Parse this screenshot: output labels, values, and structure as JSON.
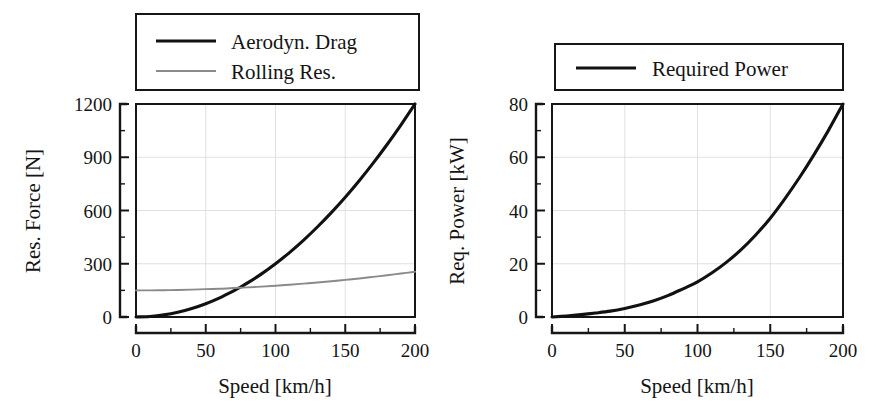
{
  "figure": {
    "panels": [
      {
        "id": "resistive-force",
        "legend": {
          "entries": [
            {
              "label": "Aerodyn. Drag",
              "style": "thick-black",
              "color": "#111111"
            },
            {
              "label": "Rolling Res.",
              "style": "thin-gray",
              "color": "#8a8a8a"
            }
          ]
        }
      },
      {
        "id": "required-power",
        "legend": {
          "entries": [
            {
              "label": "Required Power",
              "style": "thick-black",
              "color": "#111111"
            }
          ]
        }
      }
    ]
  },
  "chart_data": [
    {
      "type": "line",
      "title": "",
      "xlabel": "Speed [km/h]",
      "ylabel": "Res. Force [N]",
      "xlim": [
        0,
        200
      ],
      "ylim": [
        0,
        1200
      ],
      "xticks": [
        0,
        50,
        100,
        150,
        200
      ],
      "yticks": [
        0,
        300,
        600,
        900,
        1200
      ],
      "xticklabels": [
        "0",
        "50",
        "100",
        "150",
        "200"
      ],
      "yticklabels": [
        "0",
        "300",
        "600",
        "900",
        "1200"
      ],
      "xminor_step": 25,
      "yminor_step": 150,
      "grid": true,
      "legend_position": "above-plot",
      "x": [
        0,
        10,
        20,
        30,
        40,
        50,
        60,
        70,
        75,
        80,
        90,
        100,
        110,
        120,
        130,
        140,
        150,
        160,
        170,
        180,
        190,
        200
      ],
      "series": [
        {
          "name": "Aerodyn. Drag",
          "color": "#111111",
          "linewidth": 3.1,
          "values": [
            0,
            3,
            12,
            27,
            48,
            75,
            108,
            147,
            169,
            192,
            243,
            300,
            363,
            432,
            507,
            588,
            675,
            768,
            867,
            972,
            1083,
            1200
          ]
        },
        {
          "name": "Rolling Res.",
          "color": "#8a8a8a",
          "linewidth": 1.9,
          "values": [
            150,
            150,
            151,
            152,
            154,
            157,
            159,
            163,
            165,
            167,
            171,
            176,
            182,
            188,
            194,
            201,
            209,
            217,
            226,
            235,
            245,
            255
          ]
        }
      ]
    },
    {
      "type": "line",
      "title": "",
      "xlabel": "Speed [km/h]",
      "ylabel": "Req. Power [kW]",
      "xlim": [
        0,
        200
      ],
      "ylim": [
        0,
        80
      ],
      "xticks": [
        0,
        50,
        100,
        150,
        200
      ],
      "yticks": [
        0,
        20,
        40,
        60,
        80
      ],
      "xticklabels": [
        "0",
        "50",
        "100",
        "150",
        "200"
      ],
      "yticklabels": [
        "0",
        "20",
        "40",
        "60",
        "80"
      ],
      "xminor_step": 25,
      "yminor_step": 10,
      "grid": true,
      "legend_position": "above-plot",
      "x": [
        0,
        10,
        20,
        30,
        40,
        50,
        60,
        70,
        80,
        90,
        100,
        110,
        120,
        130,
        140,
        150,
        160,
        170,
        180,
        190,
        200
      ],
      "series": [
        {
          "name": "Required Power",
          "color": "#111111",
          "linewidth": 3.1,
          "values": [
            0,
            0.4,
            0.9,
            1.5,
            2.2,
            3.2,
            4.5,
            6.1,
            8.1,
            10.6,
            13.2,
            16.6,
            20.6,
            25.3,
            30.8,
            37.1,
            44.4,
            52.3,
            60.9,
            70.1,
            80.0
          ]
        }
      ]
    }
  ]
}
